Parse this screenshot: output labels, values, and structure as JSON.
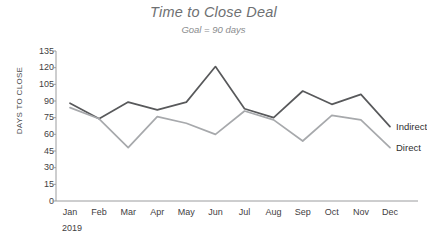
{
  "chart_data": {
    "type": "line",
    "title": "Time to Close Deal",
    "subtitle": "Goal = 90 days",
    "xlabel": "",
    "ylabel": "DAYS TO CLOSE",
    "year": "2019",
    "categories": [
      "Jan",
      "Feb",
      "Mar",
      "Apr",
      "May",
      "Jun",
      "Jul",
      "Aug",
      "Sep",
      "Oct",
      "Nov",
      "Dec"
    ],
    "ylim": [
      0,
      135
    ],
    "ytick_values": [
      0,
      15,
      30,
      45,
      60,
      75,
      90,
      105,
      120,
      135
    ],
    "ytick_labels": [
      "0",
      "15",
      "30",
      "45",
      "60",
      "75",
      "90",
      "105",
      "120",
      "135"
    ],
    "grid": false,
    "legend_position": "right-inline",
    "goal_value": 90,
    "series": [
      {
        "name": "Indirect",
        "color": "#58595b",
        "values": [
          88,
          74,
          89,
          82,
          89,
          121,
          83,
          75,
          99,
          87,
          96,
          67
        ]
      },
      {
        "name": "Direct",
        "color": "#a7a9ac",
        "values": [
          84,
          74,
          48,
          76,
          70,
          60,
          81,
          73,
          54,
          77,
          73,
          48
        ]
      }
    ]
  },
  "axis": {
    "axis_color": "#9b9c9e",
    "tick_color": "#9b9c9e",
    "text_color": "#3f4042"
  }
}
